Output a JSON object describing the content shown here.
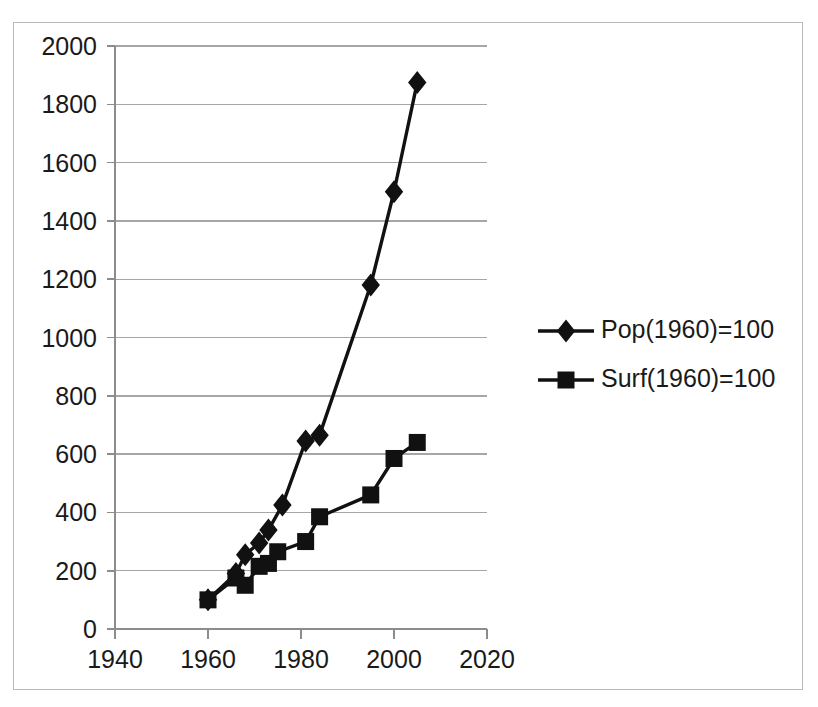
{
  "chart_data": {
    "type": "line",
    "title": "",
    "subtitle": "",
    "xlabel": "",
    "ylabel": "",
    "xlim": [
      1940,
      2020
    ],
    "ylim": [
      0,
      2000
    ],
    "x_ticks": [
      1940,
      1960,
      1980,
      2000,
      2020
    ],
    "x_tick_labels": [
      "1940",
      "1960",
      "1980",
      "2000",
      "2020"
    ],
    "y_ticks": [
      0,
      200,
      400,
      600,
      800,
      1000,
      1200,
      1400,
      1600,
      1800,
      2000
    ],
    "y_tick_labels": [
      "0",
      "200",
      "400",
      "600",
      "800",
      "1000",
      "1200",
      "1400",
      "1600",
      "1800",
      "2000"
    ],
    "grid": "horizontal",
    "legend_position": "right",
    "series": [
      {
        "name": "Pop(1960)=100",
        "marker": "diamond",
        "color": "#111111",
        "points": [
          {
            "x": 1960,
            "y": 100
          },
          {
            "x": 1966,
            "y": 190
          },
          {
            "x": 1968,
            "y": 255
          },
          {
            "x": 1971,
            "y": 295
          },
          {
            "x": 1973,
            "y": 340
          },
          {
            "x": 1976,
            "y": 425
          },
          {
            "x": 1981,
            "y": 645
          },
          {
            "x": 1984,
            "y": 665
          },
          {
            "x": 1995,
            "y": 1180
          },
          {
            "x": 2000,
            "y": 1500
          },
          {
            "x": 2005,
            "y": 1875
          }
        ]
      },
      {
        "name": "Surf(1960)=100",
        "marker": "square",
        "color": "#111111",
        "points": [
          {
            "x": 1960,
            "y": 100
          },
          {
            "x": 1966,
            "y": 175
          },
          {
            "x": 1968,
            "y": 150
          },
          {
            "x": 1971,
            "y": 215
          },
          {
            "x": 1973,
            "y": 225
          },
          {
            "x": 1975,
            "y": 265
          },
          {
            "x": 1981,
            "y": 300
          },
          {
            "x": 1984,
            "y": 385
          },
          {
            "x": 1995,
            "y": 460
          },
          {
            "x": 2000,
            "y": 585
          },
          {
            "x": 2005,
            "y": 640
          }
        ]
      }
    ]
  },
  "legend": {
    "entries": [
      {
        "label": "Pop(1960)=100",
        "marker": "diamond"
      },
      {
        "label": "Surf(1960)=100",
        "marker": "square"
      }
    ]
  }
}
